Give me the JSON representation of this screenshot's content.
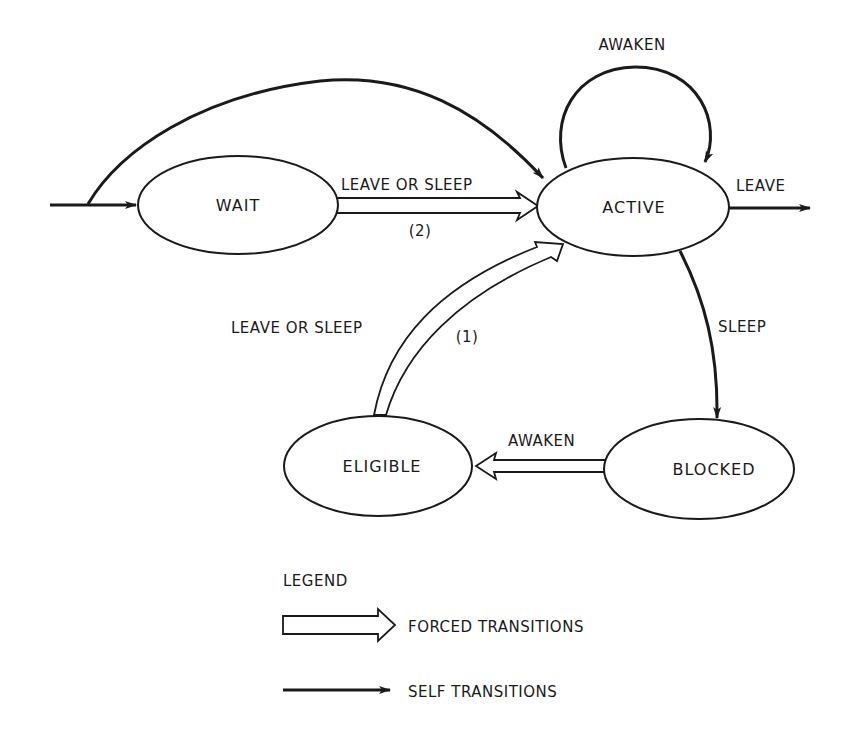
{
  "diagram": {
    "states": {
      "wait": "WAIT",
      "active": "ACTIVE",
      "eligible": "ELIGIBLE",
      "blocked": "BLOCKED"
    },
    "transitions": {
      "active_self_loop": "AWAKEN",
      "wait_to_active_label": "LEAVE OR SLEEP",
      "wait_to_active_note": "(2)",
      "active_exit": "LEAVE",
      "eligible_to_active_label": "LEAVE OR SLEEP",
      "eligible_to_active_note": "(1)",
      "active_to_blocked": "SLEEP",
      "blocked_to_eligible": "AWAKEN"
    },
    "legend": {
      "title": "LEGEND",
      "forced": "FORCED TRANSITIONS",
      "self": "SELF TRANSITIONS"
    },
    "colors": {
      "stroke": "#1a1a1a",
      "background": "#ffffff"
    }
  }
}
